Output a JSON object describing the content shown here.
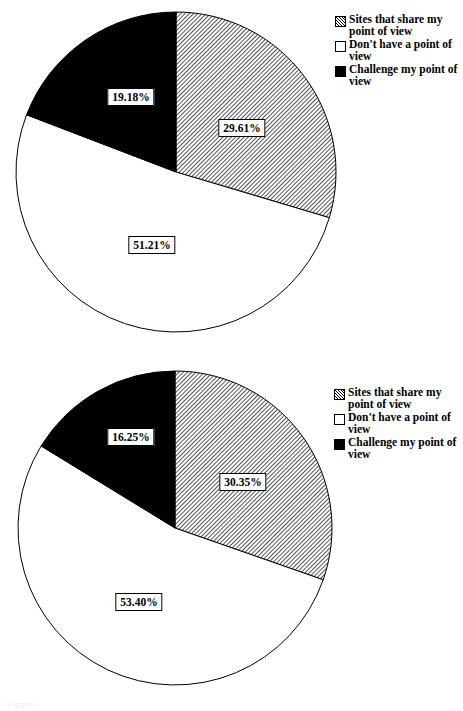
{
  "page": {
    "width": 448,
    "height": 711,
    "background": "#ffffff",
    "footer_artifact": "Figure 1"
  },
  "legend_defaults": {
    "items": [
      {
        "key": "share",
        "label": "Sites that share my point of view",
        "swatch": "hatched-square-icon"
      },
      {
        "key": "no_point",
        "label": "Don't have a point of view",
        "swatch": "white-square-icon"
      },
      {
        "key": "challenge",
        "label": "Challenge my point of view",
        "swatch": "black-square-icon"
      }
    ]
  },
  "charts": [
    {
      "id": "chart-1",
      "legend": {
        "items": [
          {
            "label": "Sites that share my point of view",
            "swatch": "hatched-square-icon"
          },
          {
            "label": "Don't have a point of view",
            "swatch": "white-square-icon"
          },
          {
            "label": "Challenge my point of view",
            "swatch": "black-square-icon"
          }
        ]
      },
      "labels": {
        "share": "29.61%",
        "no_point": "51.21%",
        "challenge": "19.18%"
      }
    },
    {
      "id": "chart-2",
      "legend": {
        "items": [
          {
            "label": "Sites that share my point of view",
            "swatch": "hatched-square-icon"
          },
          {
            "label": "Don't have a point of view",
            "swatch": "white-square-icon"
          },
          {
            "label": "Challenge my point of view",
            "swatch": "black-square-icon"
          }
        ]
      },
      "labels": {
        "share": "30.35%",
        "no_point": "53.40%",
        "challenge": "16.25%"
      }
    }
  ],
  "chart_data": [
    {
      "type": "pie",
      "title": "",
      "labels": [
        "Sites that share my point of view",
        "Don't have a point of view",
        "Challenge my point of view"
      ],
      "values": [
        29.61,
        51.21,
        19.18
      ],
      "value_labels": [
        "29.61%",
        "51.21%",
        "19.18%"
      ],
      "fills": [
        "hatched",
        "white",
        "black"
      ],
      "start_angle_deg": 0,
      "direction": "clockwise",
      "legend_position": "right",
      "grid": false,
      "units": "percent"
    },
    {
      "type": "pie",
      "title": "",
      "labels": [
        "Sites that share my point of view",
        "Don't have a point of view",
        "Challenge my point of view"
      ],
      "values": [
        30.35,
        53.4,
        16.25
      ],
      "value_labels": [
        "30.35%",
        "53.40%",
        "16.25%"
      ],
      "fills": [
        "hatched",
        "white",
        "black"
      ],
      "start_angle_deg": 0,
      "direction": "clockwise",
      "legend_position": "right",
      "grid": false,
      "units": "percent"
    }
  ]
}
